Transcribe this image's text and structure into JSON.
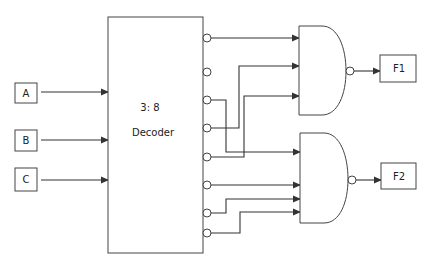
{
  "diagram": {
    "type": "logic-circuit",
    "inputs": [
      {
        "label": "A"
      },
      {
        "label": "B"
      },
      {
        "label": "C"
      }
    ],
    "decoder": {
      "line1": "3: 8",
      "line2": "Decoder",
      "outputs": 8,
      "output_type": "active-low (bubbled)"
    },
    "gates": [
      {
        "type": "NAND",
        "inputs_from_decoder_outputs": [
          1,
          4,
          5
        ],
        "output": "F1"
      },
      {
        "type": "NAND",
        "inputs_from_decoder_outputs": [
          3,
          6,
          7,
          8
        ],
        "output": "F2"
      }
    ],
    "outputs": [
      {
        "label": "F1"
      },
      {
        "label": "F2"
      }
    ],
    "colors": {
      "line": "#333333",
      "background": "#ffffff"
    }
  }
}
